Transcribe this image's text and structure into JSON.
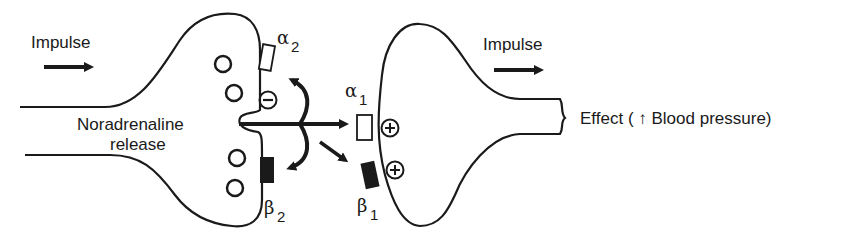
{
  "diagram": {
    "type": "noradrenergic synapse receptor diagram",
    "labels": {
      "impulse_left": "Impulse",
      "impulse_right": "Impulse",
      "release_line1": "Noradrenaline",
      "release_line2": "release",
      "effect": "Effect ( ↑ Blood pressure)"
    },
    "receptors": {
      "alpha2": {
        "symbol": "α",
        "subscript": "2",
        "style": "open",
        "effect": "⊖"
      },
      "beta2": {
        "symbol": "β",
        "subscript": "2",
        "style": "filled",
        "effect": ""
      },
      "alpha1": {
        "symbol": "α",
        "subscript": "1",
        "style": "open",
        "effect": "⊕"
      },
      "beta1": {
        "symbol": "β",
        "subscript": "1",
        "style": "filled",
        "effect": "⊕"
      }
    },
    "signs": {
      "inhibit": "−",
      "stimulate": "+"
    },
    "colors": {
      "stroke": "#1a1a1a",
      "background": "#ffffff"
    }
  }
}
